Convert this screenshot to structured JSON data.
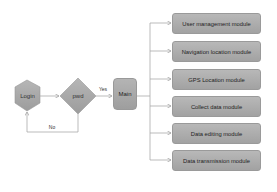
{
  "diagram": {
    "nodes": {
      "login": {
        "label": "Login",
        "shape": "hexagon"
      },
      "decision": {
        "label": "pwd",
        "shape": "diamond"
      },
      "main": {
        "label": "Main",
        "shape": "rounded-rect"
      }
    },
    "edges": {
      "yes_label": "Yes",
      "no_label": "No"
    },
    "modules": [
      {
        "label": "User management module"
      },
      {
        "label": "Navigation location module"
      },
      {
        "label": "GPS Location module"
      },
      {
        "label": "Collect data module"
      },
      {
        "label": "Data editing module"
      },
      {
        "label": "Data transmission module"
      }
    ],
    "colors": {
      "node_fill": "#a8a8a8",
      "line": "#9a9a9a",
      "background": "#ffffff"
    }
  }
}
